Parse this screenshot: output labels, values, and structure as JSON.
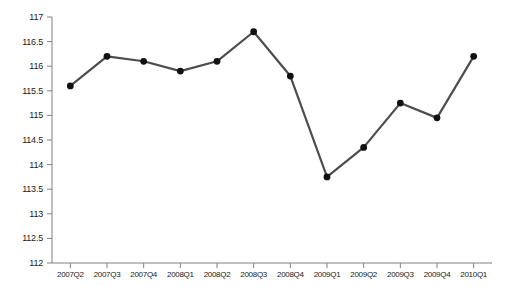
{
  "chart_data": {
    "type": "line",
    "title": "",
    "subtitle": "",
    "xlabel": "",
    "ylabel": "",
    "categories": [
      "2007Q2",
      "2007Q3",
      "2007Q4",
      "2008Q1",
      "2008Q2",
      "2008Q3",
      "2008Q4",
      "2009Q1",
      "2009Q2",
      "2009Q3",
      "2009Q4",
      "2010Q1"
    ],
    "values": [
      115.6,
      116.2,
      116.1,
      115.9,
      116.1,
      116.7,
      115.8,
      113.75,
      114.35,
      115.25,
      114.95,
      116.2
    ],
    "series": [
      {
        "name": "",
        "values": [
          115.6,
          116.2,
          116.1,
          115.9,
          116.1,
          116.7,
          115.8,
          113.75,
          114.35,
          115.25,
          114.95,
          116.2
        ]
      }
    ],
    "ylim": [
      112,
      117
    ],
    "yticks": [
      112,
      112.5,
      113,
      113.5,
      114,
      114.5,
      115,
      115.5,
      116,
      116.5,
      117
    ],
    "ytick_labels": [
      "112",
      "112.5",
      "113",
      "113.5",
      "114",
      "114.5",
      "115",
      "115.5",
      "116",
      "116.5",
      "117"
    ],
    "xtick_labels": [
      "2007Q2",
      "2007Q3",
      "2007Q4",
      "2008Q1",
      "2008Q2",
      "2008Q3",
      "2008Q4",
      "2009Q1",
      "2009Q2",
      "2009Q3",
      "2009Q4",
      "2010Q1"
    ],
    "grid": false,
    "legend": "none",
    "line_color": "#4d4d4d",
    "marker_color": "#111111",
    "axis_color": "#808080",
    "background_color": "#ffffff",
    "marker": "circle",
    "line_width": 2.2,
    "marker_size": 3.4
  }
}
